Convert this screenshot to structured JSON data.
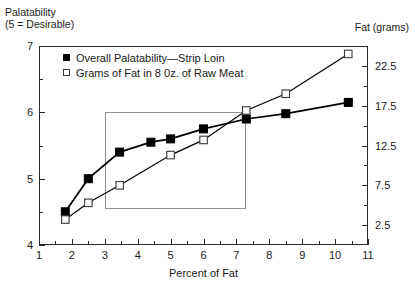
{
  "figure": {
    "left_axis_caption_line1": "Palatability",
    "left_axis_caption_line2": "(5 = Desirable)",
    "right_axis_caption": "Fat (grams)",
    "xaxis_title": "Percent of Fat",
    "series_color_filled": "#000000",
    "series_color_open": "#ffffff",
    "line_color": "#000000",
    "frame_color": "#2b2b2b",
    "inner_box_color": "#8d8d8d"
  },
  "legend": {
    "position": "top-left-inside",
    "items": [
      {
        "marker": "filled-square-marker",
        "label": "Overall Palatability—Strip Loin"
      },
      {
        "marker": "open-square-marker",
        "label": "Grams of Fat in 8 0z. of Raw Meat"
      }
    ]
  },
  "chart_data": {
    "type": "line",
    "title": "",
    "subtitle": "",
    "xlabel": "Percent of Fat",
    "ylabel": "Palatability (5 = Desirable)",
    "y2label": "Fat (grams)",
    "grid": false,
    "legend_position": "upper left",
    "xlim": [
      1,
      11
    ],
    "xticks": [
      1,
      2,
      3,
      4,
      5,
      6,
      7,
      8,
      9,
      10,
      11
    ],
    "xticklabels": [
      "1",
      "2",
      "3",
      "4",
      "5",
      "6",
      "7",
      "8",
      "9",
      "10",
      "11"
    ],
    "xminor_ticks": [
      1.5,
      2.5,
      3.5,
      4.5,
      5.5,
      6.5,
      7.5,
      8.5,
      9.5,
      10.5
    ],
    "ylim": [
      4,
      7
    ],
    "yticks": [
      4,
      5,
      6,
      7
    ],
    "yticklabels": [
      "4",
      "5",
      "6",
      "7"
    ],
    "yminor_ticks": [
      4.5,
      5.5,
      6.5
    ],
    "y2lim": [
      0,
      25
    ],
    "y2ticks": [
      2.5,
      7.5,
      12.5,
      17.5,
      22.5
    ],
    "y2ticklabels": [
      "2.5",
      "7.5",
      "12.5",
      "17.5",
      "22.5"
    ],
    "y2minor_ticks": [
      5,
      10,
      15,
      20
    ],
    "annotations": [
      {
        "kind": "highlight-rectangle",
        "x_range": [
          3.0,
          7.3
        ],
        "y_range": [
          4.55,
          6.0
        ],
        "axis": "left"
      }
    ],
    "series": [
      {
        "name": "Overall Palatability—Strip Loin",
        "axis": "left",
        "marker": "filled-square",
        "x": [
          1.8,
          2.5,
          3.45,
          4.4,
          5.0,
          6.0,
          7.3,
          8.5,
          10.4
        ],
        "values": [
          4.5,
          5.0,
          5.4,
          5.55,
          5.6,
          5.75,
          5.9,
          5.98,
          6.15
        ]
      },
      {
        "name": "Grams of Fat in 8 0z. of Raw Meat",
        "axis": "right",
        "marker": "open-square",
        "x": [
          1.8,
          2.5,
          3.45,
          5.0,
          6.0,
          7.3,
          8.5,
          10.4
        ],
        "values": [
          3.2,
          5.3,
          7.5,
          11.3,
          13.2,
          16.9,
          19.0,
          24.0
        ]
      }
    ]
  }
}
